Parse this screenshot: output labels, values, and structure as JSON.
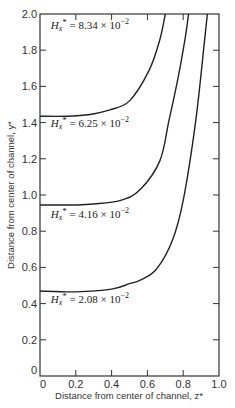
{
  "chart_data": {
    "type": "line",
    "title": "",
    "xlabel": "Distance from center of channel, z*",
    "ylabel": "Distance from center of channel, y*",
    "xlim": [
      0,
      1.0
    ],
    "ylim": [
      0,
      2.0
    ],
    "xticks": [
      0,
      0.2,
      0.4,
      0.6,
      0.8,
      1.0
    ],
    "xtick_labels": [
      "0",
      "0.2",
      "0.4",
      "0.6",
      "0.8",
      "1.0"
    ],
    "yticks": [
      0,
      0.2,
      0.4,
      0.6,
      0.8,
      1.0,
      1.2,
      1.4,
      1.6,
      1.8,
      2.0
    ],
    "ytick_labels": [
      "0",
      "0.2",
      "0.4",
      "0.6",
      "0.8",
      "1.0",
      "1.2",
      "1.4",
      "1.6",
      "1.8",
      "2.0"
    ],
    "grid": false,
    "legend": "none (inline annotations)",
    "series": [
      {
        "name": "Hx* = 2.08 × 10^-2",
        "x": [
          0.0,
          0.2,
          0.4,
          0.5,
          0.56,
          0.65,
          0.74,
          0.8,
          0.87,
          0.92,
          0.935
        ],
        "y": [
          0.47,
          0.465,
          0.48,
          0.51,
          0.53,
          0.59,
          0.75,
          0.97,
          1.41,
          1.86,
          2.0
        ]
      },
      {
        "name": "Hx* = 6.25 × 10^-2",
        "x": [
          0.0,
          0.2,
          0.3,
          0.45,
          0.56,
          0.67,
          0.72,
          0.77,
          0.81,
          0.83
        ],
        "y": [
          0.945,
          0.945,
          0.95,
          0.97,
          1.03,
          1.19,
          1.41,
          1.64,
          1.86,
          2.0
        ]
      },
      {
        "name": "Hx* = 8.34 × 10^-2",
        "x": [
          0.0,
          0.15,
          0.28,
          0.39,
          0.5,
          0.61,
          0.67,
          0.7
        ],
        "y": [
          1.435,
          1.435,
          1.445,
          1.47,
          1.52,
          1.69,
          1.86,
          2.0
        ]
      }
    ],
    "annotations": [
      {
        "prefix": "H",
        "sub": "x",
        "sup": "*",
        "value": " = 8.34 × 10",
        "exp": "−2",
        "x": 0.06,
        "y": 1.915
      },
      {
        "prefix": "H",
        "sub": "x",
        "sup": "*",
        "value": " = 6.25 × 10",
        "exp": "−2",
        "x": 0.06,
        "y": 1.375
      },
      {
        "prefix": "H",
        "sub": "x",
        "sup": "*",
        "value": " = 4.16 × 10",
        "exp": "−2",
        "x": 0.06,
        "y": 0.875
      },
      {
        "prefix": "H",
        "sub": "x",
        "sup": "*",
        "value": " = 2.08 × 10",
        "exp": "−2",
        "x": 0.06,
        "y": 0.405
      }
    ],
    "annotation_note": "Curve labels as printed: top curve (y≈1.44) sits between 8.34 and 6.25 labels; middle curve (y≈0.95) above 4.16 label; bottom curve (y≈0.47) above 2.08 label."
  },
  "colors": {
    "line": "#222222",
    "axis": "#333333",
    "background": "#ffffff"
  }
}
